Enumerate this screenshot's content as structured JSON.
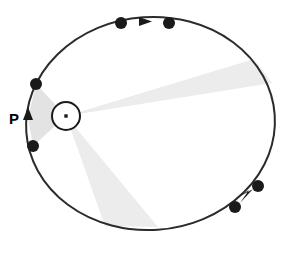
{
  "figure": {
    "name": "kepler-equal-areas-orbit-diagram",
    "background_color": "#ffffff",
    "width": 288,
    "height": 258
  },
  "colors": {
    "orbit_stroke": "#2b2b2b",
    "sector_fill": "#e3e3e3",
    "sector_fill_light": "#ececec",
    "planet_fill": "#1a1a1a",
    "arrow_fill": "#1a1a1a",
    "sun_stroke": "#1a1a1a",
    "sun_fill": "#ffffff",
    "label_color": "#000000"
  },
  "orbit": {
    "type": "ellipse",
    "center_x": 150.5,
    "center_y": 123.5,
    "radius_x": 124.5,
    "radius_y": 106.5,
    "rotation_deg": -4,
    "stroke_width": 2.0
  },
  "sun": {
    "label": "",
    "center_x": 66,
    "center_y": 116,
    "radius": 14,
    "stroke_width": 2.0,
    "core_size": 3.4
  },
  "labels": [
    {
      "id": "perihelion-label",
      "text": "P",
      "x": 9,
      "y": 120,
      "font_size": 15
    }
  ],
  "sectors": [
    {
      "id": "perihelion-sector",
      "name": "sector-perihelion-left",
      "points": "66,116 36,84 28,118 33,146",
      "opacity": 1.0,
      "fill_key": "sector_fill"
    },
    {
      "id": "aphelion-sector",
      "name": "sector-aphelion-right",
      "points": "66,116 254,59 272,83",
      "opacity": 1.0,
      "fill_key": "sector_fill_light"
    },
    {
      "id": "lower-sector",
      "name": "sector-lower",
      "points": "66,116 105,226 158,227",
      "opacity": 1.0,
      "fill_key": "sector_fill_light"
    }
  ],
  "planets": [
    {
      "id": "planet-top-left",
      "x": 121,
      "y": 23,
      "r": 6.0
    },
    {
      "id": "planet-top-right",
      "x": 169,
      "y": 23,
      "r": 6.0
    },
    {
      "id": "planet-right-upper",
      "x": 258,
      "y": 186,
      "r": 6.0
    },
    {
      "id": "planet-right-lower",
      "x": 235,
      "y": 207,
      "r": 6.0
    },
    {
      "id": "planet-left-upper",
      "x": 36,
      "y": 84,
      "r": 6.0
    },
    {
      "id": "planet-left-lower",
      "x": 33,
      "y": 146,
      "r": 6.0
    }
  ],
  "arrows": [
    {
      "id": "arrow-top",
      "name": "direction-arrow-top",
      "points": "139,17 152,21.5 139,26",
      "direction": "right"
    },
    {
      "id": "arrow-right",
      "name": "direction-arrow-lower-right",
      "points": "253,189 240,203 249,190 237,198",
      "direction": "down-left"
    },
    {
      "id": "arrow-left",
      "name": "direction-arrow-perihelion",
      "points": "28,107 33,120 23,120",
      "direction": "up"
    }
  ],
  "accessibility": {
    "description": "Elliptical orbit with a central body and three shaded sectors of equal area; planet positions marked by dots and motion direction by arrowheads."
  }
}
